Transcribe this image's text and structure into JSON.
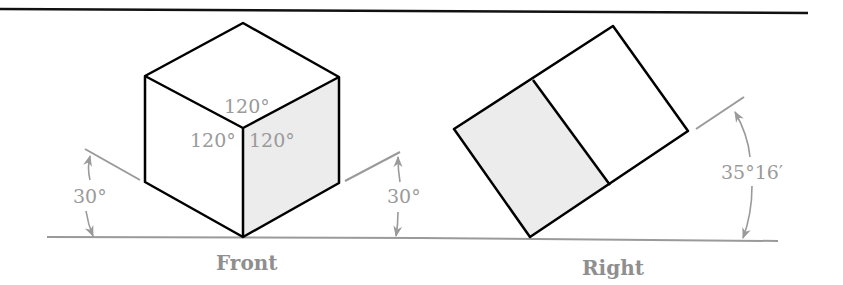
{
  "diagram": {
    "colors": {
      "outline": "#000000",
      "dimension": "#9a9a9a",
      "shaded_face": "#ececec",
      "background": "#ffffff"
    },
    "front_view": {
      "caption": "Front",
      "face_angles": [
        "120°",
        "120°",
        "120°"
      ],
      "left_angle": "30°",
      "right_angle": "30°"
    },
    "right_view": {
      "caption": "Right",
      "tilt_angle": "35°16′"
    }
  }
}
